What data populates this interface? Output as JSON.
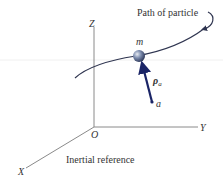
{
  "diagram": {
    "caption": "Inertial reference",
    "path_label": "Path of particle",
    "axes": {
      "z": "Z",
      "y": "Y",
      "x": "X",
      "origin": "O"
    },
    "particle_label": "m",
    "point_label": "a",
    "vector_label": "ρ",
    "vector_subscript": "a",
    "colors": {
      "axis": "#8a8a8a",
      "path": "#2f3550",
      "vector": "#1a2466",
      "text": "#333333",
      "particle": "#3d4f7a"
    }
  }
}
